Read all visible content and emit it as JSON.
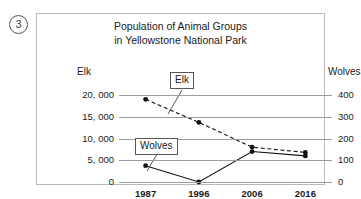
{
  "problem_number": "3",
  "title": {
    "line1": "Population of Animal Groups",
    "line2": "in Yellowstone National Park"
  },
  "left_axis_name": "Elk",
  "right_axis_name": "Wolves",
  "callouts": {
    "elk": "Elk",
    "wolves": "Wolves"
  },
  "chart_data": {
    "type": "line",
    "title": "Population of Animal Groups in Yellowstone National Park",
    "xlabel": "",
    "ylabel": "Elk",
    "y2label": "Wolves",
    "categories": [
      "1987",
      "1996",
      "2006",
      "2016"
    ],
    "grid": true,
    "legend_position": "inline-callout",
    "ylim": [
      0,
      20000
    ],
    "yticks": [
      0,
      5000,
      10000,
      15000,
      20000
    ],
    "ytick_labels": [
      "0",
      "5, 000",
      "10, 000",
      "15, 000",
      "20, 000"
    ],
    "y2lim": [
      0,
      400
    ],
    "y2ticks": [
      0,
      100,
      200,
      300,
      400
    ],
    "y2tick_labels": [
      "0",
      "100",
      "200",
      "300",
      "400"
    ],
    "series": [
      {
        "name": "Elk",
        "axis": "left",
        "style": "dashed",
        "marker": "circle",
        "values": [
          19000,
          13700,
          8000,
          6800
        ]
      },
      {
        "name": "Wolves",
        "axis": "right",
        "style": "solid",
        "marker": "circle",
        "values": [
          75,
          0,
          140,
          120
        ]
      }
    ],
    "annotations": [
      {
        "text": "Elk",
        "target_series": "Elk"
      },
      {
        "text": "Wolves",
        "target_series": "Wolves"
      }
    ]
  }
}
